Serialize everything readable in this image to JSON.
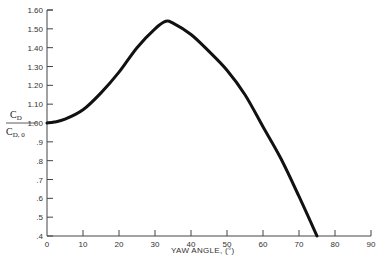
{
  "chart_data": {
    "type": "line",
    "title": "",
    "xlabel": "YAW ANGLE, (°)",
    "ylabel": "C_D / C_D,0",
    "ylabel_parts": {
      "num_main": "C",
      "num_sub": "D",
      "den_main": "C",
      "den_sub": "D, 0"
    },
    "xlim": [
      0,
      90
    ],
    "ylim": [
      0.4,
      1.6
    ],
    "grid": false,
    "legend": null,
    "x_ticks": [
      0,
      10,
      20,
      30,
      40,
      50,
      60,
      70,
      80,
      90
    ],
    "x_tick_labels": [
      "0",
      "10",
      "20",
      "30",
      "40",
      "50",
      "60",
      "70",
      "80",
      "90"
    ],
    "y_ticks": [
      0.4,
      0.5,
      0.6,
      0.7,
      0.8,
      0.9,
      1.0,
      1.1,
      1.2,
      1.3,
      1.4,
      1.5,
      1.6
    ],
    "y_tick_labels": [
      ".4",
      ".5",
      ".6",
      ".7",
      ".8",
      ".9",
      "1.00",
      "1.10",
      "1.20",
      "1.30",
      "1.40",
      "1.50",
      "1.60"
    ],
    "series": [
      {
        "name": "C_D / C_D,0 vs yaw angle",
        "color": "#111111",
        "x": [
          0,
          2,
          5,
          10,
          15,
          20,
          25,
          30,
          33,
          35,
          40,
          45,
          50,
          55,
          60,
          65,
          70,
          75
        ],
        "y": [
          1.0,
          1.005,
          1.02,
          1.07,
          1.16,
          1.27,
          1.4,
          1.5,
          1.54,
          1.53,
          1.47,
          1.38,
          1.28,
          1.15,
          0.98,
          0.81,
          0.61,
          0.4
        ]
      }
    ]
  }
}
